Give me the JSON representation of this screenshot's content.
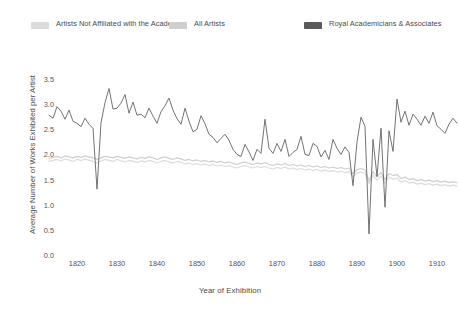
{
  "legend": {
    "items": [
      {
        "label": "Artists Not Affiliated with the Academy",
        "color": "#dcdcdc"
      },
      {
        "label": "All Artists",
        "color": "#cfcfcf"
      },
      {
        "label": "Royal Academicians & Associates",
        "color": "#5a5a5a"
      }
    ]
  },
  "chart_data": {
    "type": "line",
    "title": "",
    "xlabel": "Year of Exhibition",
    "ylabel": "Average Number of Works Exhibited per Artist",
    "xlim": [
      1813,
      1915
    ],
    "ylim": [
      0.0,
      3.5
    ],
    "xticks": [
      1820,
      1830,
      1840,
      1850,
      1860,
      1870,
      1880,
      1890,
      1900,
      1910
    ],
    "xtick_labels": [
      "1820",
      "1830",
      "1840",
      "1850",
      "1860",
      "1870",
      "1880",
      "1890",
      "1900",
      "1910"
    ],
    "yticks": [
      0.0,
      0.5,
      1.0,
      1.5,
      2.0,
      2.5,
      3.0,
      3.5
    ],
    "ytick_labels": [
      "0.0",
      "0.5",
      "1.0",
      "1.5",
      "2.0",
      "2.5",
      "3.0",
      "3.5"
    ],
    "grid": false,
    "legend_position": "top",
    "x": [
      1813,
      1814,
      1815,
      1816,
      1817,
      1818,
      1819,
      1820,
      1821,
      1822,
      1823,
      1824,
      1825,
      1826,
      1827,
      1828,
      1829,
      1830,
      1831,
      1832,
      1833,
      1834,
      1835,
      1836,
      1837,
      1838,
      1839,
      1840,
      1841,
      1842,
      1843,
      1844,
      1845,
      1846,
      1847,
      1848,
      1849,
      1850,
      1851,
      1852,
      1853,
      1854,
      1855,
      1856,
      1857,
      1858,
      1859,
      1860,
      1861,
      1862,
      1863,
      1864,
      1865,
      1866,
      1867,
      1868,
      1869,
      1870,
      1871,
      1872,
      1873,
      1874,
      1875,
      1876,
      1877,
      1878,
      1879,
      1880,
      1881,
      1882,
      1883,
      1884,
      1885,
      1886,
      1887,
      1888,
      1889,
      1890,
      1891,
      1892,
      1893,
      1894,
      1895,
      1896,
      1897,
      1898,
      1899,
      1900,
      1901,
      1902,
      1903,
      1904,
      1905,
      1906,
      1907,
      1908,
      1909,
      1910,
      1911,
      1912,
      1913,
      1914,
      1915
    ],
    "series": [
      {
        "name": "Royal Academicians & Associates",
        "color": "#5a5a5a",
        "values": [
          2.78,
          2.72,
          2.95,
          2.86,
          2.7,
          2.88,
          2.66,
          2.62,
          2.55,
          2.72,
          2.6,
          2.52,
          1.31,
          2.63,
          3.03,
          3.31,
          2.9,
          2.92,
          3.02,
          3.19,
          2.82,
          3.04,
          2.78,
          2.8,
          2.73,
          2.92,
          2.76,
          2.62,
          2.85,
          2.97,
          3.12,
          2.88,
          2.71,
          2.6,
          2.92,
          2.66,
          2.45,
          2.5,
          2.77,
          2.61,
          2.4,
          2.34,
          2.23,
          2.32,
          2.4,
          2.28,
          2.1,
          2.0,
          1.96,
          2.2,
          2.05,
          1.88,
          2.1,
          2.02,
          2.7,
          2.12,
          2.02,
          2.22,
          2.06,
          2.3,
          1.96,
          2.04,
          2.1,
          2.36,
          2.0,
          1.98,
          2.22,
          2.16,
          1.95,
          2.08,
          1.9,
          2.3,
          2.12,
          2.0,
          2.15,
          2.04,
          1.38,
          2.25,
          2.74,
          2.56,
          0.42,
          2.3,
          1.56,
          2.52,
          0.95,
          2.47,
          2.06,
          3.1,
          2.64,
          2.86,
          2.58,
          2.8,
          2.7,
          2.58,
          2.76,
          2.62,
          2.84,
          2.57,
          2.5,
          2.42,
          2.6,
          2.72,
          2.62
        ]
      },
      {
        "name": "All Artists",
        "color": "#cfcfcf",
        "values": [
          1.92,
          1.94,
          1.96,
          1.93,
          1.97,
          1.95,
          1.93,
          1.96,
          1.94,
          1.97,
          1.95,
          1.93,
          1.9,
          1.93,
          1.96,
          1.95,
          1.93,
          1.96,
          1.94,
          1.92,
          1.95,
          1.93,
          1.91,
          1.94,
          1.92,
          1.95,
          1.93,
          1.9,
          1.93,
          1.95,
          1.92,
          1.9,
          1.93,
          1.91,
          1.88,
          1.9,
          1.87,
          1.89,
          1.86,
          1.88,
          1.85,
          1.87,
          1.84,
          1.86,
          1.83,
          1.85,
          1.82,
          1.8,
          1.83,
          1.85,
          1.82,
          1.8,
          1.83,
          1.81,
          1.84,
          1.8,
          1.78,
          1.81,
          1.79,
          1.82,
          1.78,
          1.8,
          1.77,
          1.79,
          1.76,
          1.78,
          1.75,
          1.77,
          1.74,
          1.76,
          1.73,
          1.75,
          1.72,
          1.74,
          1.71,
          1.73,
          1.62,
          1.7,
          1.72,
          1.69,
          1.48,
          1.66,
          1.56,
          1.64,
          1.5,
          1.62,
          1.58,
          1.6,
          1.52,
          1.55,
          1.5,
          1.52,
          1.48,
          1.5,
          1.47,
          1.49,
          1.46,
          1.48,
          1.45,
          1.47,
          1.44,
          1.46,
          1.44
        ]
      },
      {
        "name": "Artists Not Affiliated with the Academy",
        "color": "#dcdcdc",
        "values": [
          1.86,
          1.88,
          1.9,
          1.87,
          1.91,
          1.89,
          1.86,
          1.9,
          1.88,
          1.91,
          1.88,
          1.86,
          1.83,
          1.87,
          1.9,
          1.88,
          1.86,
          1.9,
          1.87,
          1.85,
          1.88,
          1.86,
          1.84,
          1.87,
          1.85,
          1.88,
          1.86,
          1.83,
          1.86,
          1.88,
          1.85,
          1.83,
          1.86,
          1.84,
          1.81,
          1.83,
          1.8,
          1.82,
          1.79,
          1.81,
          1.78,
          1.8,
          1.77,
          1.79,
          1.76,
          1.78,
          1.75,
          1.73,
          1.76,
          1.78,
          1.75,
          1.73,
          1.76,
          1.74,
          1.76,
          1.73,
          1.71,
          1.74,
          1.72,
          1.75,
          1.71,
          1.73,
          1.7,
          1.72,
          1.69,
          1.71,
          1.68,
          1.7,
          1.67,
          1.69,
          1.66,
          1.68,
          1.65,
          1.67,
          1.64,
          1.66,
          1.56,
          1.63,
          1.65,
          1.62,
          1.42,
          1.59,
          1.49,
          1.57,
          1.43,
          1.55,
          1.51,
          1.53,
          1.45,
          1.48,
          1.43,
          1.45,
          1.41,
          1.43,
          1.4,
          1.42,
          1.39,
          1.41,
          1.38,
          1.4,
          1.37,
          1.39,
          1.37
        ]
      }
    ]
  }
}
